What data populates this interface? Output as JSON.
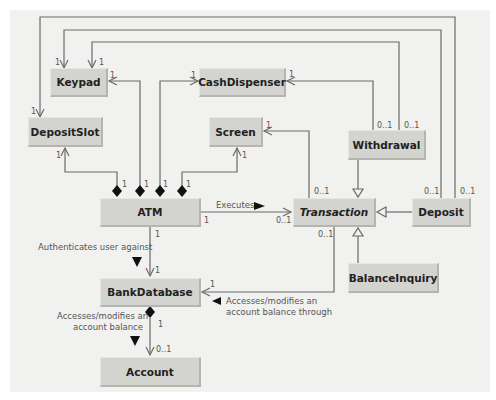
{
  "diagram": {
    "type": "UML class diagram",
    "classes": {
      "keypad": "Keypad",
      "cash_dispenser": "CashDispenser",
      "deposit_slot": "DepositSlot",
      "screen": "Screen",
      "withdrawal": "Withdrawal",
      "atm": "ATM",
      "transaction": "Transaction",
      "deposit": "Deposit",
      "balance_inquiry": "BalanceInquiry",
      "bank_database": "BankDatabase",
      "account": "Account"
    },
    "labels": {
      "executes": "Executes",
      "authenticates": "Authenticates user against",
      "accesses_db_1": "Accesses/modifies an",
      "accesses_db_2": "account balance",
      "accesses_tx_1": "Accesses/modifies an",
      "accesses_tx_2": "account balance through"
    },
    "multiplicities": {
      "one": "1",
      "zero_or_one": "0..1"
    },
    "relationships": [
      {
        "from": "ATM",
        "to": "Keypad",
        "kind": "composition",
        "mult_from": "1",
        "mult_to": "1"
      },
      {
        "from": "ATM",
        "to": "CashDispenser",
        "kind": "composition",
        "mult_from": "1",
        "mult_to": "1"
      },
      {
        "from": "ATM",
        "to": "DepositSlot",
        "kind": "composition",
        "mult_from": "1",
        "mult_to": "1"
      },
      {
        "from": "ATM",
        "to": "Screen",
        "kind": "composition",
        "mult_from": "1",
        "mult_to": "1"
      },
      {
        "from": "ATM",
        "to": "Transaction",
        "kind": "association",
        "label": "Executes",
        "mult_from": "1",
        "mult_to": "0..1"
      },
      {
        "from": "ATM",
        "to": "BankDatabase",
        "kind": "association",
        "label": "Authenticates user against",
        "mult_from": "1",
        "mult_to": "1"
      },
      {
        "from": "BankDatabase",
        "to": "Account",
        "kind": "composition",
        "label": "Accesses/modifies an account balance",
        "mult_from": "1",
        "mult_to": "0..1"
      },
      {
        "from": "Transaction",
        "to": "BankDatabase",
        "kind": "association",
        "label": "Accesses/modifies an account balance through",
        "mult_from": "0..1",
        "mult_to": "1"
      },
      {
        "from": "Transaction",
        "to": "Screen",
        "kind": "association",
        "mult_from": "0..1",
        "mult_to": "1"
      },
      {
        "from": "Withdrawal",
        "to": "Transaction",
        "kind": "generalization"
      },
      {
        "from": "Deposit",
        "to": "Transaction",
        "kind": "generalization"
      },
      {
        "from": "BalanceInquiry",
        "to": "Transaction",
        "kind": "generalization"
      },
      {
        "from": "Withdrawal",
        "to": "CashDispenser",
        "kind": "association",
        "mult_from": "0..1",
        "mult_to": "1"
      },
      {
        "from": "Withdrawal",
        "to": "Keypad",
        "kind": "association",
        "mult_from": "0..1",
        "mult_to": "1"
      },
      {
        "from": "Deposit",
        "to": "Keypad",
        "kind": "association",
        "mult_from": "0..1",
        "mult_to": "1"
      },
      {
        "from": "Deposit",
        "to": "DepositSlot",
        "kind": "association",
        "mult_from": "0..1",
        "mult_to": "1"
      }
    ],
    "colors": {
      "box_fill": "#d3d3cf",
      "panel_bg": "#f1f1ef",
      "line": "#666666",
      "text": "#222222"
    }
  }
}
